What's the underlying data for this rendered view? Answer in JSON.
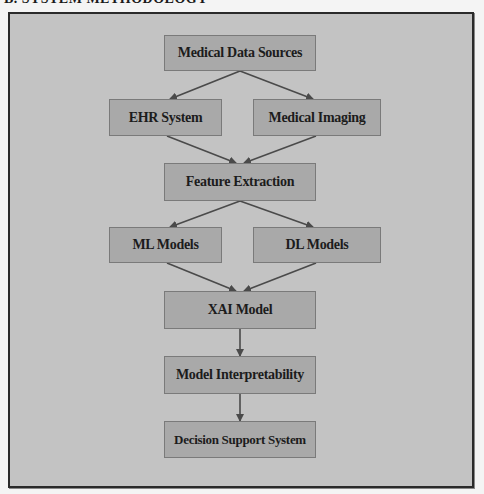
{
  "heading": "B. SYSTEM METHODOLOGY",
  "colors": {
    "background": "#c3c3c3",
    "node_fill": "#a9a9a9",
    "node_border": "#7a7a7a",
    "edge": "#4a4a4a",
    "frame_border": "#2a2a2a"
  },
  "diagram": {
    "nodes": [
      {
        "id": "sources",
        "label": "Medical Data Sources"
      },
      {
        "id": "ehr",
        "label": "EHR System"
      },
      {
        "id": "imaging",
        "label": "Medical Imaging"
      },
      {
        "id": "features",
        "label": "Feature Extraction"
      },
      {
        "id": "ml",
        "label": "ML Models"
      },
      {
        "id": "dl",
        "label": "DL Models"
      },
      {
        "id": "xai",
        "label": "XAI Model"
      },
      {
        "id": "interp",
        "label": "Model Interpretability"
      },
      {
        "id": "dss",
        "label": "Decision Support System"
      }
    ],
    "edges": [
      {
        "from": "sources",
        "to": "ehr"
      },
      {
        "from": "sources",
        "to": "imaging"
      },
      {
        "from": "ehr",
        "to": "features"
      },
      {
        "from": "imaging",
        "to": "features"
      },
      {
        "from": "features",
        "to": "ml"
      },
      {
        "from": "features",
        "to": "dl"
      },
      {
        "from": "ml",
        "to": "xai"
      },
      {
        "from": "dl",
        "to": "xai"
      },
      {
        "from": "xai",
        "to": "interp"
      },
      {
        "from": "interp",
        "to": "dss"
      }
    ]
  }
}
